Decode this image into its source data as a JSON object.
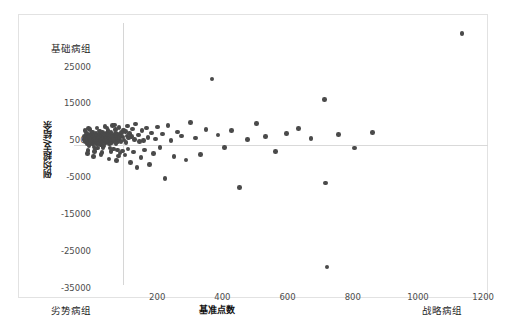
{
  "chart_data": {
    "type": "scatter",
    "title": "",
    "xlabel": "基准点数",
    "ylabel": "例均超支/结余",
    "xlim": [
      0,
      1270
    ],
    "ylim": [
      -38000,
      33000
    ],
    "grid": false,
    "legend": null,
    "x_ticks": [
      200,
      400,
      600,
      800,
      1000,
      1200
    ],
    "y_ticks": [
      25000,
      15000,
      5000,
      -5000,
      -15000,
      -25000,
      -35000
    ],
    "reference_lines": {
      "vertical_x": 150,
      "horizontal_y": 0
    },
    "quadrant_labels": {
      "top_left": "基础病组",
      "bottom_left": "劣势病组",
      "bottom_right": "战略病组"
    },
    "marker_color": "#4a4a4a",
    "series": [
      {
        "name": "病组",
        "points": [
          [
            31,
            1500
          ],
          [
            35,
            900
          ],
          [
            38,
            2100
          ],
          [
            40,
            400
          ],
          [
            42,
            2600
          ],
          [
            44,
            1200
          ],
          [
            46,
            -200
          ],
          [
            48,
            1900
          ],
          [
            50,
            2800
          ],
          [
            52,
            600
          ],
          [
            54,
            1500
          ],
          [
            55,
            3100
          ],
          [
            57,
            200
          ],
          [
            58,
            2200
          ],
          [
            60,
            1100
          ],
          [
            61,
            -600
          ],
          [
            63,
            2500
          ],
          [
            64,
            1700
          ],
          [
            66,
            900
          ],
          [
            67,
            3000
          ],
          [
            69,
            300
          ],
          [
            70,
            2000
          ],
          [
            72,
            1400
          ],
          [
            73,
            -900
          ],
          [
            75,
            2400
          ],
          [
            76,
            1800
          ],
          [
            78,
            700
          ],
          [
            79,
            2900
          ],
          [
            81,
            1200
          ],
          [
            82,
            100
          ],
          [
            84,
            2200
          ],
          [
            85,
            1600
          ],
          [
            87,
            3300
          ],
          [
            88,
            800
          ],
          [
            90,
            1900
          ],
          [
            91,
            -300
          ],
          [
            93,
            2600
          ],
          [
            94,
            1300
          ],
          [
            96,
            2100
          ],
          [
            97,
            500
          ],
          [
            99,
            3000
          ],
          [
            100,
            1700
          ],
          [
            102,
            2300
          ],
          [
            103,
            900
          ],
          [
            105,
            1400
          ],
          [
            106,
            2800
          ],
          [
            108,
            200
          ],
          [
            109,
            1900
          ],
          [
            111,
            2500
          ],
          [
            112,
            1100
          ],
          [
            114,
            3400
          ],
          [
            115,
            600
          ],
          [
            117,
            2000
          ],
          [
            118,
            1500
          ],
          [
            120,
            2700
          ],
          [
            121,
            -1200
          ],
          [
            123,
            1800
          ],
          [
            124,
            2400
          ],
          [
            126,
            1000
          ],
          [
            127,
            3100
          ],
          [
            129,
            400
          ],
          [
            131,
            2200
          ],
          [
            132,
            1600
          ],
          [
            134,
            2900
          ],
          [
            135,
            800
          ],
          [
            137,
            1300
          ],
          [
            139,
            2500
          ],
          [
            140,
            1900
          ],
          [
            33,
            2300
          ],
          [
            36,
            1400
          ],
          [
            39,
            3200
          ],
          [
            43,
            -1500
          ],
          [
            47,
            2700
          ],
          [
            51,
            1000
          ],
          [
            56,
            3500
          ],
          [
            62,
            -1800
          ],
          [
            68,
            2600
          ],
          [
            74,
            400
          ],
          [
            80,
            3600
          ],
          [
            86,
            -2100
          ],
          [
            92,
            2800
          ],
          [
            98,
            1200
          ],
          [
            104,
            3800
          ],
          [
            110,
            -900
          ],
          [
            116,
            2300
          ],
          [
            122,
            1500
          ],
          [
            128,
            4100
          ],
          [
            133,
            -1400
          ],
          [
            45,
            4400
          ],
          [
            59,
            -3200
          ],
          [
            71,
            4600
          ],
          [
            83,
            -2600
          ],
          [
            95,
            4900
          ],
          [
            107,
            -3800
          ],
          [
            119,
            5200
          ],
          [
            130,
            -4300
          ],
          [
            138,
            4700
          ],
          [
            141,
            -2200
          ],
          [
            34,
            3900
          ],
          [
            41,
            -2400
          ],
          [
            49,
            4200
          ],
          [
            65,
            -1100
          ],
          [
            77,
            3700
          ],
          [
            89,
            -700
          ],
          [
            101,
            4500
          ],
          [
            113,
            -1900
          ],
          [
            125,
            5400
          ],
          [
            136,
            -3000
          ],
          [
            142,
            2600
          ],
          [
            144,
            900
          ],
          [
            146,
            3300
          ],
          [
            148,
            -1700
          ],
          [
            150,
            2100
          ],
          [
            152,
            4000
          ],
          [
            154,
            1300
          ],
          [
            156,
            -2800
          ],
          [
            158,
            3600
          ],
          [
            160,
            600
          ],
          [
            162,
            2400
          ],
          [
            164,
            5100
          ],
          [
            166,
            -1200
          ],
          [
            168,
            1800
          ],
          [
            171,
            3000
          ],
          [
            174,
            -4800
          ],
          [
            177,
            2200
          ],
          [
            180,
            4300
          ],
          [
            183,
            -2000
          ],
          [
            186,
            1500
          ],
          [
            189,
            5600
          ],
          [
            193,
            -6200
          ],
          [
            197,
            2700
          ],
          [
            201,
            900
          ],
          [
            205,
            -3500
          ],
          [
            209,
            3800
          ],
          [
            213,
            1100
          ],
          [
            217,
            -1400
          ],
          [
            222,
            4600
          ],
          [
            227,
            2000
          ],
          [
            232,
            -5400
          ],
          [
            238,
            3200
          ],
          [
            244,
            -2300
          ],
          [
            250,
            1600
          ],
          [
            257,
            4800
          ],
          [
            264,
            -700
          ],
          [
            271,
            2900
          ],
          [
            279,
            -9200
          ],
          [
            288,
            5300
          ],
          [
            297,
            1200
          ],
          [
            307,
            -3100
          ],
          [
            318,
            3500
          ],
          [
            330,
            2400
          ],
          [
            343,
            -4100
          ],
          [
            357,
            6100
          ],
          [
            372,
            1800
          ],
          [
            388,
            -2700
          ],
          [
            405,
            4100
          ],
          [
            423,
            17800
          ],
          [
            442,
            2600
          ],
          [
            462,
            -800
          ],
          [
            484,
            3900
          ],
          [
            507,
            -11600
          ],
          [
            532,
            1400
          ],
          [
            559,
            5700
          ],
          [
            588,
            2300
          ],
          [
            619,
            -1900
          ],
          [
            652,
            3100
          ],
          [
            688,
            4400
          ],
          [
            727,
            1700
          ],
          [
            768,
            12200
          ],
          [
            772,
            -10400
          ],
          [
            776,
            -33100
          ],
          [
            812,
            2800
          ],
          [
            860,
            -900
          ],
          [
            915,
            3400
          ],
          [
            1190,
            30200
          ]
        ]
      }
    ]
  }
}
